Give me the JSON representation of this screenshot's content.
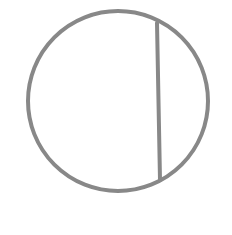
{
  "diagram": {
    "background": "#ffffff",
    "stroke_color": "#888888",
    "stroke_width": 4,
    "circle": {
      "cx": 118,
      "cy": 101,
      "r": 90
    },
    "chord": {
      "x1": 157,
      "y1": 23,
      "x2": 160,
      "y2": 180
    }
  }
}
